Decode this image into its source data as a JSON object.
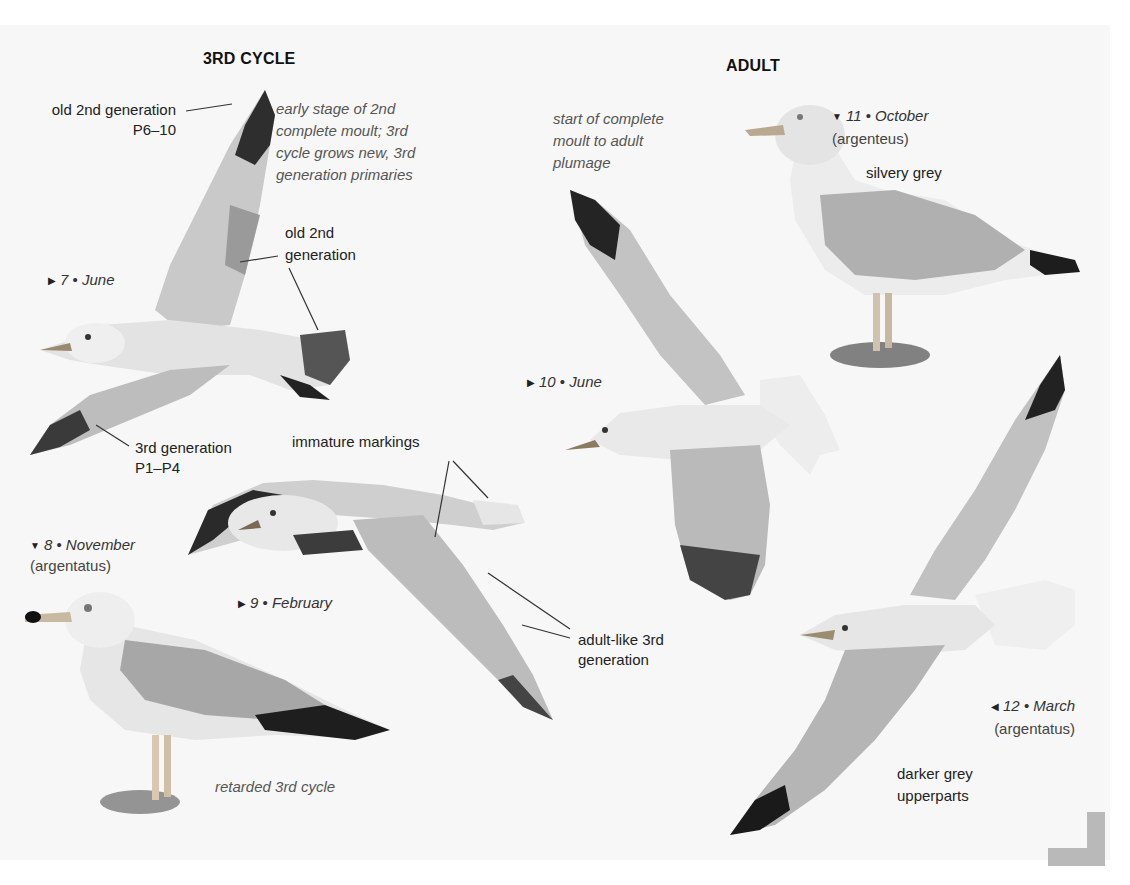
{
  "sections": {
    "third_cycle": {
      "title": "3RD CYCLE"
    },
    "adult": {
      "title": "ADULT"
    }
  },
  "figures": [
    {
      "id": 7,
      "marker": "▶",
      "number": "7",
      "month": "June",
      "subspecies": ""
    },
    {
      "id": 8,
      "marker": "▼",
      "number": "8",
      "month": "November",
      "subspecies": "(argentatus)"
    },
    {
      "id": 9,
      "marker": "▶",
      "number": "9",
      "month": "February",
      "subspecies": ""
    },
    {
      "id": 10,
      "marker": "▶",
      "number": "10",
      "month": "June",
      "subspecies": ""
    },
    {
      "id": 11,
      "marker": "▼",
      "number": "11",
      "month": "October",
      "subspecies": "(argenteus)"
    },
    {
      "id": 12,
      "marker": "◀",
      "number": "12",
      "month": "March",
      "subspecies": "(argentatus)"
    }
  ],
  "separator": "•",
  "annotations": {
    "old_2nd_gen_p6_10": {
      "line1": "old 2nd generation",
      "line2": "P6–10"
    },
    "early_stage_note": {
      "line1": "early stage of 2nd",
      "line2": "complete moult; 3rd",
      "line3": "cycle grows new, 3rd",
      "line4": "generation primaries"
    },
    "old_2nd_gen": {
      "line1": "old 2nd",
      "line2": "generation"
    },
    "third_gen_p1_p4": {
      "line1": "3rd generation",
      "line2": "P1–P4"
    },
    "immature_markings": {
      "text": "immature markings"
    },
    "adult_like_3rd_gen": {
      "line1": "adult-like 3rd",
      "line2": "generation"
    },
    "retarded_3rd_cycle": {
      "text": "retarded 3rd cycle"
    },
    "start_of_moult": {
      "line1": "start of complete",
      "line2": "moult to adult",
      "line3": "plumage"
    },
    "silvery_grey": {
      "text": "silvery grey"
    },
    "darker_grey": {
      "line1": "darker grey",
      "line2": "upperparts"
    }
  }
}
